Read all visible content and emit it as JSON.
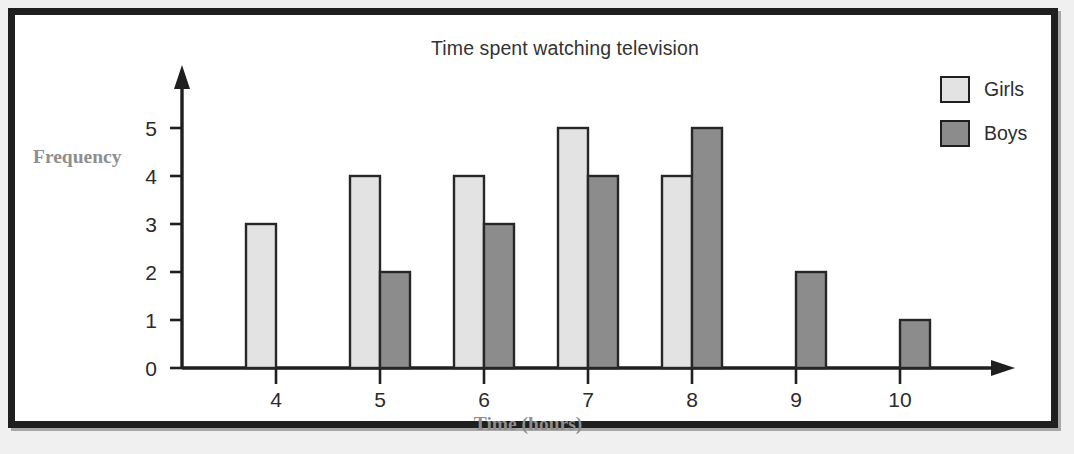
{
  "figure": {
    "title": "Time spent watching television",
    "frame_color": "#201f1f",
    "background": "#ffffff"
  },
  "legend": {
    "position": "top-right",
    "entries": [
      {
        "label": "Girls",
        "color": "#e3e3e3",
        "swatch_name": "legend-swatch-girls"
      },
      {
        "label": "Boys",
        "color": "#8c8c8c",
        "swatch_name": "legend-swatch-boys"
      }
    ]
  },
  "axes": {
    "y_title": "Frequency",
    "x_title": "Time (hours)",
    "y_ticks": [
      "0",
      "1",
      "2",
      "3",
      "4",
      "5"
    ],
    "x_ticks": [
      "4",
      "5",
      "6",
      "7",
      "8",
      "9",
      "10"
    ],
    "label_color": "#8e8e8e"
  },
  "chart_data": {
    "type": "bar",
    "title": "Time spent watching television",
    "xlabel": "Time (hours)",
    "ylabel": "Frequency",
    "categories": [
      "4",
      "5",
      "6",
      "7",
      "8",
      "9",
      "10"
    ],
    "series": [
      {
        "name": "Girls",
        "color": "#e3e3e3",
        "values": [
          3,
          4,
          4,
          5,
          4,
          0,
          0
        ]
      },
      {
        "name": "Boys",
        "color": "#8c8c8c",
        "values": [
          0,
          2,
          3,
          4,
          5,
          2,
          1
        ]
      }
    ],
    "ylim": [
      0,
      5
    ],
    "yticks": [
      0,
      1,
      2,
      3,
      4,
      5
    ],
    "grid": false,
    "legend_position": "top-right"
  }
}
